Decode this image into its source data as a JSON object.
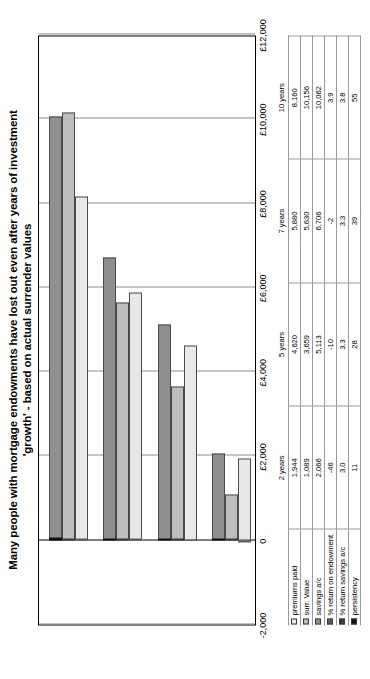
{
  "chart_data": {
    "type": "bar",
    "orientation": "horizontal",
    "title": "Many people with mortgage endowments have lost out even after years of investment 'growth' - based on actual surrender values",
    "title_line1": "Many people with mortgage endowments have lost out even after years of investment",
    "title_line2": "'growth' - based on actual surrender values",
    "xlabel": "",
    "ylabel": "",
    "categories": [
      "2 years",
      "5 years",
      "7 years",
      "10 years"
    ],
    "axis_ticks": [
      "-2,000",
      "0",
      "£2,000",
      "£4,000",
      "£6,000",
      "£8,000",
      "£10,000",
      "£12,000"
    ],
    "axis_tick_values": [
      -2000,
      0,
      2000,
      4000,
      6000,
      8000,
      10000,
      12000
    ],
    "ylim": [
      -2000,
      12000
    ],
    "grid": true,
    "legend_position": "table-row-labels",
    "series": [
      {
        "name": "premiums paid",
        "color": "#e8e8e8",
        "values": [
          1944,
          4620,
          5880,
          8160
        ]
      },
      {
        "name": "surr. Value",
        "color": "#bdbdbd",
        "values": [
          1089,
          3659,
          5630,
          10156
        ]
      },
      {
        "name": "savings a/c",
        "color": "#8f8f8f",
        "values": [
          2066,
          5113,
          6706,
          10062
        ]
      },
      {
        "name": "% return on endowment",
        "color": "#5a5a5a",
        "values": [
          -46,
          -10,
          -2,
          3.9
        ]
      },
      {
        "name": "% return savings a/c",
        "color": "#3a3a3a",
        "values": [
          3.0,
          3.3,
          3.3,
          3.8
        ]
      },
      {
        "name": "persistency",
        "color": "#111111",
        "values": [
          11,
          28,
          39,
          55
        ]
      }
    ],
    "table": {
      "row_labels": [
        "premiums paid",
        "surr. Value",
        "savings a/c",
        "% return on endowment",
        "% return savings a/c",
        "persistency"
      ],
      "column_headers": [
        "2 years",
        "5 years",
        "7 years",
        "10 years"
      ],
      "rows": [
        [
          "1,944",
          "4,620",
          "5,880",
          "8,160"
        ],
        [
          "1,089",
          "3,659",
          "5,630",
          "10,156"
        ],
        [
          "2,066",
          "5,113",
          "6,706",
          "10,062"
        ],
        [
          "-46",
          "-10",
          "-2",
          "3.9"
        ],
        [
          "3.0",
          "3.3",
          "3.3",
          "3.8"
        ],
        [
          "11",
          "28",
          "39",
          "55"
        ]
      ]
    }
  }
}
